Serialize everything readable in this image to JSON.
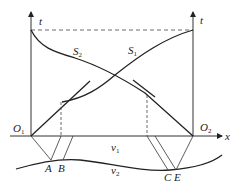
{
  "diagram": {
    "type": "physics-wave-reflection",
    "axes": {
      "left_t_label": "t",
      "right_t_label": "t",
      "x_label": "x",
      "origin_left": {
        "letter": "O",
        "sub": "1"
      },
      "origin_right": {
        "letter": "O",
        "sub": "2"
      }
    },
    "curves": {
      "s1": {
        "letter": "S",
        "sub": "1"
      },
      "s2": {
        "letter": "S",
        "sub": "2"
      }
    },
    "media": {
      "v1": {
        "letter": "v",
        "sub": "1"
      },
      "v2": {
        "letter": "v",
        "sub": "2"
      }
    },
    "points": [
      "A",
      "B",
      "C",
      "E"
    ]
  }
}
